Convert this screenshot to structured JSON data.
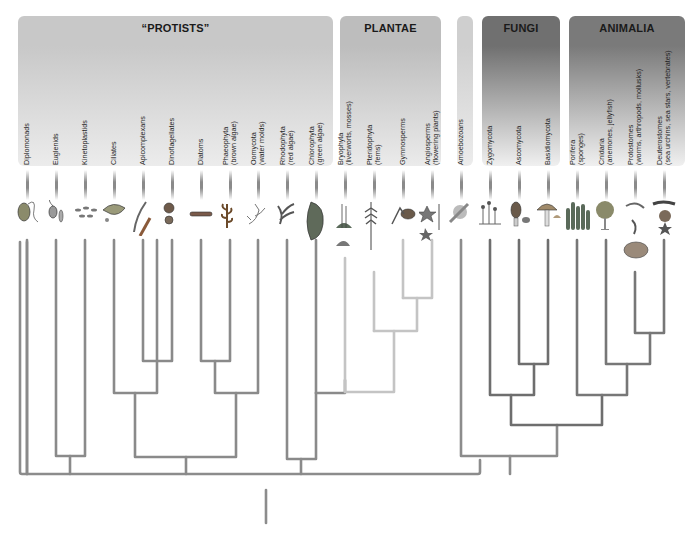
{
  "groups": [
    {
      "id": "protists",
      "title": "“PROTISTS”",
      "x": 18,
      "w": 315,
      "h": 150,
      "color_top": "#c8c8c8",
      "color_bottom": "#ececec"
    },
    {
      "id": "plantae",
      "title": "PLANTAE",
      "x": 340,
      "w": 101,
      "h": 150,
      "color_top": "#bdbdbd",
      "color_bottom": "#ebebeb"
    },
    {
      "id": "amoebozoa",
      "title": "",
      "x": 457,
      "w": 16,
      "h": 150,
      "color_top": "#cfcfcf",
      "color_bottom": "#ececec"
    },
    {
      "id": "fungi",
      "title": "FUNGI",
      "x": 482,
      "w": 78,
      "h": 150,
      "color_top": "#707070",
      "color_bottom": "#f0f0f0"
    },
    {
      "id": "animalia",
      "title": "ANIMALIA",
      "x": 569,
      "w": 116,
      "h": 150,
      "color_top": "#7a7a7a",
      "color_bottom": "#f0f0f0"
    }
  ],
  "taxa": [
    {
      "name": "Diplomonads",
      "sub": "",
      "x": 27,
      "icon": "diplomonad-icon"
    },
    {
      "name": "Euglenids",
      "sub": "",
      "x": 56,
      "icon": "euglenid-icon"
    },
    {
      "name": "Kinetoplastids",
      "sub": "",
      "x": 85,
      "icon": "kinetoplastid-icon"
    },
    {
      "name": "Ciliates",
      "sub": "",
      "x": 114,
      "icon": "ciliate-icon"
    },
    {
      "name": "Apicomplexans",
      "sub": "",
      "x": 143,
      "icon": "apicomplexan-icon"
    },
    {
      "name": "Dinoflagellates",
      "sub": "",
      "x": 172,
      "icon": "dinoflagellate-icon"
    },
    {
      "name": "Diatoms",
      "sub": "",
      "x": 201,
      "icon": "diatom-icon"
    },
    {
      "name": "Phaeophyta",
      "sub": "(brown algae)",
      "x": 230,
      "icon": "brown-algae-icon"
    },
    {
      "name": "Oomycota",
      "sub": "(water molds)",
      "x": 258,
      "icon": "water-mold-icon"
    },
    {
      "name": "Rhodophyta",
      "sub": "(red algae)",
      "x": 287,
      "icon": "red-algae-icon"
    },
    {
      "name": "Chlorophyta",
      "sub": "(green algae)",
      "x": 316,
      "icon": "green-algae-icon"
    },
    {
      "name": "Bryophyta",
      "sub": "(liverworts, mosses)",
      "x": 345,
      "icon": "moss-icon"
    },
    {
      "name": "Pteridophyta",
      "sub": "(ferns)",
      "x": 374,
      "icon": "fern-icon"
    },
    {
      "name": "Gymnosperms",
      "sub": "",
      "x": 403,
      "icon": "pine-cone-icon"
    },
    {
      "name": "Angiosperms",
      "sub": "(flowering plants)",
      "x": 432,
      "icon": "flower-icon"
    },
    {
      "name": "Amoebozoans",
      "sub": "",
      "x": 461,
      "icon": "amoeba-icon"
    },
    {
      "name": "Zygomycota",
      "sub": "",
      "x": 490,
      "icon": "bread-mold-icon"
    },
    {
      "name": "Ascomycota",
      "sub": "",
      "x": 519,
      "icon": "morel-icon"
    },
    {
      "name": "Basidiomycota",
      "sub": "",
      "x": 548,
      "icon": "mushroom-icon"
    },
    {
      "name": "Porifera",
      "sub": "(sponges)",
      "x": 577,
      "icon": "sponge-icon"
    },
    {
      "name": "Cnidaria",
      "sub": "(anemones, jellyfish)",
      "x": 606,
      "icon": "anemone-icon"
    },
    {
      "name": "Protostomes",
      "sub": "(worms, arthropods, mollusks)",
      "x": 635,
      "icon": "mollusk-icon"
    },
    {
      "name": "Deuterostomes",
      "sub": "(sea urchins, sea stars, vertebrates)",
      "x": 664,
      "icon": "sea-star-icon"
    }
  ],
  "tree_colors": {
    "protist": "#8a8a8a",
    "plant": "#c4c4c4",
    "fungi": "#6e6e6e",
    "animal": "#777777",
    "root": "#8c8c8c"
  }
}
